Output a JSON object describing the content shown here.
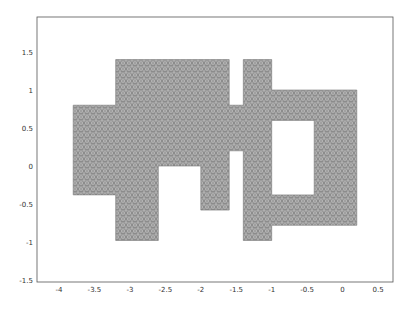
{
  "chart_data": {
    "type": "mesh",
    "title": "",
    "xlabel": "",
    "ylabel": "",
    "xlim": [
      -4.3,
      0.72
    ],
    "ylim": [
      -1.53,
      1.97
    ],
    "grid": false,
    "legend": null,
    "xticks": [
      -4,
      -3.5,
      -3,
      -2.5,
      -2,
      -1.5,
      -1,
      -0.5,
      0,
      0.5
    ],
    "xtick_labels": [
      "-4",
      "-3.5",
      "-3",
      "-2.5",
      "-2",
      "-1.5",
      "-1",
      "-0.5",
      "0",
      "0.5"
    ],
    "yticks": [
      -1.5,
      -1,
      -0.5,
      0,
      0.5,
      1,
      1.5
    ],
    "ytick_labels": [
      "-1.5",
      "-1",
      "-0.5",
      "0",
      "0.5",
      "1",
      "1.5"
    ],
    "fill_color": "#8a8a8a",
    "domain_outer": [
      [
        -3.8,
        0.8
      ],
      [
        -3.2,
        0.8
      ],
      [
        -3.2,
        1.4
      ],
      [
        -1.6,
        1.4
      ],
      [
        -1.6,
        0.8
      ],
      [
        -1.4,
        0.8
      ],
      [
        -1.4,
        1.4
      ],
      [
        -1.0,
        1.4
      ],
      [
        -1.0,
        1.0
      ],
      [
        0.2,
        1.0
      ],
      [
        0.2,
        -0.78
      ],
      [
        -1.0,
        -0.78
      ],
      [
        -1.0,
        -0.98
      ],
      [
        -1.4,
        -0.98
      ],
      [
        -1.4,
        0.2
      ],
      [
        -1.6,
        0.2
      ],
      [
        -1.6,
        -0.58
      ],
      [
        -2.0,
        -0.58
      ],
      [
        -2.0,
        0.0
      ],
      [
        -2.6,
        0.0
      ],
      [
        -2.6,
        -0.98
      ],
      [
        -3.2,
        -0.98
      ],
      [
        -3.2,
        -0.38
      ],
      [
        -3.8,
        -0.38
      ]
    ],
    "domain_holes": [
      [
        [
          -1.0,
          0.6
        ],
        [
          -0.4,
          0.6
        ],
        [
          -0.4,
          -0.38
        ],
        [
          -1.0,
          -0.38
        ]
      ]
    ]
  }
}
